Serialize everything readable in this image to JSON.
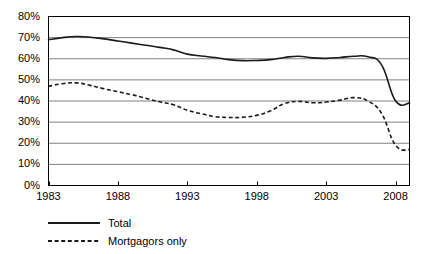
{
  "chart_data": {
    "type": "line",
    "title": "",
    "xlabel": "",
    "ylabel": "",
    "xlim": [
      1983,
      2009
    ],
    "ylim": [
      0,
      80
    ],
    "grid": true,
    "grid_axis": "y",
    "legend_position": "below-left",
    "x_ticks": [
      "1983",
      "1988",
      "1993",
      "1998",
      "2003",
      "2008"
    ],
    "x_tick_values": [
      1983,
      1988,
      1993,
      1998,
      2003,
      2008
    ],
    "y_ticks": [
      "0%",
      "10%",
      "20%",
      "30%",
      "40%",
      "50%",
      "60%",
      "70%",
      "80%"
    ],
    "y_tick_values": [
      0,
      10,
      20,
      30,
      40,
      50,
      60,
      70,
      80
    ],
    "x": [
      1983,
      1984,
      1985,
      1986,
      1987,
      1988,
      1989,
      1990,
      1991,
      1992,
      1993,
      1994,
      1995,
      1996,
      1997,
      1998,
      1999,
      2000,
      2001,
      2002,
      2003,
      2004,
      2005,
      2006,
      2007,
      2008,
      2009
    ],
    "series": [
      {
        "name": "Total",
        "style": "solid",
        "color": "#1a1a1a",
        "values": [
          69.0,
          70.0,
          70.5,
          70.2,
          69.4,
          68.4,
          67.4,
          66.4,
          65.4,
          64.2,
          62.2,
          61.3,
          60.6,
          59.6,
          59.1,
          59.2,
          59.6,
          60.6,
          61.2,
          60.4,
          60.2,
          60.6,
          61.2,
          60.9,
          57.0,
          40.0,
          39.0
        ]
      },
      {
        "name": "Mortgagors only",
        "style": "dashed",
        "color": "#1a1a1a",
        "values": [
          47.0,
          48.2,
          48.6,
          47.4,
          45.8,
          44.4,
          43.0,
          41.3,
          39.6,
          38.2,
          35.6,
          34.0,
          32.6,
          32.2,
          32.3,
          33.2,
          35.4,
          38.8,
          39.8,
          39.2,
          39.5,
          40.4,
          41.6,
          40.0,
          34.0,
          19.0,
          17.0
        ]
      }
    ]
  },
  "legend": {
    "entries": [
      {
        "label": "Total",
        "key": "solid-line-key"
      },
      {
        "label": "Mortgagors only",
        "key": "dashed-line-key"
      }
    ]
  }
}
